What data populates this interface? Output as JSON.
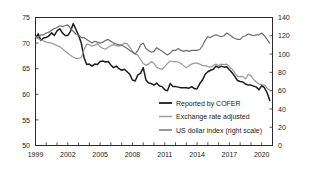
{
  "chart_data": {
    "type": "line",
    "title": "",
    "subtitle": "",
    "xlabel": "",
    "ylabel": "",
    "y2label": "",
    "xlim": [
      1999,
      2021
    ],
    "ylim": [
      50,
      75
    ],
    "y2lim": [
      0,
      140
    ],
    "grid": false,
    "legend_position": "inside-center-bottom",
    "x_ticks": [
      "1999",
      "2002",
      "2005",
      "2008",
      "2011",
      "2014",
      "2017",
      "2020"
    ],
    "x_tick_values": [
      1999,
      2002,
      2005,
      2008,
      2011,
      2014,
      2017,
      2020
    ],
    "x_minor_tick_values": [
      1999,
      2000,
      2001,
      2002,
      2003,
      2004,
      2005,
      2006,
      2007,
      2008,
      2009,
      2010,
      2011,
      2012,
      2013,
      2014,
      2015,
      2016,
      2017,
      2018,
      2019,
      2020,
      2021
    ],
    "y_ticks": [
      "75",
      "70",
      "65",
      "60",
      "55",
      "50"
    ],
    "y_tick_values": [
      75,
      70,
      65,
      60,
      55,
      50
    ],
    "y2_ticks": [
      "140",
      "120",
      "100",
      "80",
      "60",
      "40",
      "20",
      "0"
    ],
    "y2_tick_values": [
      140,
      120,
      100,
      80,
      60,
      40,
      20,
      0
    ],
    "series": [
      {
        "name": "Reported by COFER",
        "axis": "left",
        "color": "#1c1c1c",
        "width": 1.5,
        "x": [
          1999.0,
          1999.25,
          1999.5,
          1999.75,
          2000.0,
          2000.25,
          2000.5,
          2000.75,
          2001.0,
          2001.25,
          2001.5,
          2001.75,
          2002.0,
          2002.25,
          2002.5,
          2002.75,
          2003.0,
          2003.25,
          2003.5,
          2003.75,
          2004.0,
          2004.25,
          2004.5,
          2004.75,
          2005.0,
          2005.25,
          2005.5,
          2005.75,
          2006.0,
          2006.25,
          2006.5,
          2006.75,
          2007.0,
          2007.25,
          2007.5,
          2007.75,
          2008.0,
          2008.25,
          2008.5,
          2008.75,
          2009.0,
          2009.25,
          2009.5,
          2009.75,
          2010.0,
          2010.25,
          2010.5,
          2010.75,
          2011.0,
          2011.25,
          2011.5,
          2011.75,
          2012.0,
          2012.25,
          2012.5,
          2012.75,
          2013.0,
          2013.25,
          2013.5,
          2013.75,
          2014.0,
          2014.25,
          2014.5,
          2014.75,
          2015.0,
          2015.25,
          2015.5,
          2015.75,
          2016.0,
          2016.25,
          2016.5,
          2016.75,
          2017.0,
          2017.25,
          2017.5,
          2017.75,
          2018.0,
          2018.25,
          2018.5,
          2018.75,
          2019.0,
          2019.25,
          2019.5,
          2019.75,
          2020.0,
          2020.25,
          2020.5,
          2020.75
        ],
        "values": [
          70.9,
          71.8,
          70.5,
          71.0,
          71.1,
          71.4,
          72.0,
          71.5,
          72.4,
          72.8,
          72.0,
          71.5,
          71.5,
          72.3,
          73.8,
          72.7,
          71.5,
          70.0,
          67.2,
          65.8,
          65.9,
          65.5,
          65.9,
          65.8,
          66.4,
          66.5,
          66.3,
          66.4,
          65.7,
          65.2,
          65.5,
          65.0,
          64.7,
          64.9,
          64.4,
          63.9,
          62.8,
          62.6,
          63.8,
          64.1,
          65.2,
          62.8,
          62.2,
          62.1,
          61.8,
          62.2,
          61.6,
          61.5,
          60.9,
          60.7,
          62.1,
          61.5,
          61.5,
          61.4,
          61.3,
          61.3,
          61.3,
          61.2,
          61.5,
          61.1,
          61.1,
          62.1,
          62.8,
          63.9,
          64.4,
          64.7,
          64.9,
          65.5,
          65.2,
          65.5,
          65.3,
          65.4,
          64.8,
          64.2,
          63.5,
          62.7,
          62.5,
          62.4,
          62.0,
          61.8,
          61.8,
          61.6,
          61.4,
          60.9,
          61.7,
          61.3,
          60.3,
          58.8
        ]
      },
      {
        "name": "Exchange rate adjusted",
        "axis": "left",
        "color": "#9a9a9a",
        "width": 1.2,
        "x": [
          1999.0,
          1999.25,
          1999.5,
          1999.75,
          2000.0,
          2000.25,
          2000.5,
          2000.75,
          2001.0,
          2001.25,
          2001.5,
          2001.75,
          2002.0,
          2002.25,
          2002.5,
          2002.75,
          2003.0,
          2003.25,
          2003.5,
          2003.75,
          2004.0,
          2004.25,
          2004.5,
          2004.75,
          2005.0,
          2005.25,
          2005.5,
          2005.75,
          2006.0,
          2006.25,
          2006.5,
          2006.75,
          2007.0,
          2007.25,
          2007.5,
          2007.75,
          2008.0,
          2008.25,
          2008.5,
          2008.75,
          2009.0,
          2009.25,
          2009.5,
          2009.75,
          2010.0,
          2010.25,
          2010.5,
          2010.75,
          2011.0,
          2011.25,
          2011.5,
          2011.75,
          2012.0,
          2012.25,
          2012.5,
          2012.75,
          2013.0,
          2013.25,
          2013.5,
          2013.75,
          2014.0,
          2014.25,
          2014.5,
          2014.75,
          2015.0,
          2015.25,
          2015.5,
          2015.75,
          2016.0,
          2016.25,
          2016.5,
          2016.75,
          2017.0,
          2017.25,
          2017.5,
          2017.75,
          2018.0,
          2018.25,
          2018.5,
          2018.75,
          2019.0,
          2019.25,
          2019.5,
          2019.75,
          2020.0,
          2020.25,
          2020.5,
          2020.75
        ],
        "values": [
          71.2,
          70.9,
          70.6,
          70.4,
          70.2,
          70.1,
          70.0,
          69.8,
          69.5,
          69.3,
          68.9,
          68.4,
          68.0,
          67.6,
          67.3,
          67.0,
          67.0,
          67.2,
          68.7,
          69.8,
          69.7,
          69.4,
          69.6,
          69.9,
          69.3,
          69.0,
          68.8,
          69.2,
          69.5,
          69.7,
          69.5,
          69.4,
          69.6,
          70.0,
          69.9,
          69.2,
          68.4,
          67.9,
          67.6,
          66.8,
          66.0,
          65.7,
          65.9,
          66.4,
          66.0,
          65.3,
          65.0,
          64.9,
          65.4,
          66.0,
          66.5,
          66.4,
          66.4,
          66.3,
          66.0,
          65.6,
          65.2,
          65.6,
          65.9,
          66.1,
          66.1,
          65.9,
          65.6,
          65.6,
          65.4,
          65.3,
          65.6,
          65.9,
          65.6,
          65.9,
          65.8,
          65.9,
          65.4,
          64.9,
          64.2,
          63.5,
          63.4,
          63.5,
          63.0,
          63.9,
          63.6,
          62.9,
          62.4,
          62.0,
          61.9,
          61.8,
          61.2,
          60.8
        ]
      },
      {
        "name": "US dollar index (right scale)",
        "axis": "right",
        "color": "#6e6e6e",
        "width": 1.2,
        "x": [
          1999.0,
          1999.25,
          1999.5,
          1999.75,
          2000.0,
          2000.25,
          2000.5,
          2000.75,
          2001.0,
          2001.25,
          2001.5,
          2001.75,
          2002.0,
          2002.25,
          2002.5,
          2002.75,
          2003.0,
          2003.25,
          2003.5,
          2003.75,
          2004.0,
          2004.25,
          2004.5,
          2004.75,
          2005.0,
          2005.25,
          2005.5,
          2005.75,
          2006.0,
          2006.25,
          2006.5,
          2006.75,
          2007.0,
          2007.25,
          2007.5,
          2007.75,
          2008.0,
          2008.25,
          2008.5,
          2008.75,
          2009.0,
          2009.25,
          2009.5,
          2009.75,
          2010.0,
          2010.25,
          2010.5,
          2010.75,
          2011.0,
          2011.25,
          2011.5,
          2011.75,
          2012.0,
          2012.25,
          2012.5,
          2012.75,
          2013.0,
          2013.25,
          2013.5,
          2013.75,
          2014.0,
          2014.25,
          2014.5,
          2014.75,
          2015.0,
          2015.25,
          2015.5,
          2015.75,
          2016.0,
          2016.25,
          2016.5,
          2016.75,
          2017.0,
          2017.25,
          2017.5,
          2017.75,
          2018.0,
          2018.25,
          2018.5,
          2018.75,
          2019.0,
          2019.25,
          2019.5,
          2019.75,
          2020.0,
          2020.25,
          2020.5,
          2020.75
        ],
        "values": [
          119,
          118,
          121,
          121,
          123,
          124,
          126,
          128,
          129,
          131,
          130,
          131,
          132,
          128,
          125,
          122,
          121,
          118,
          118,
          116,
          114,
          112,
          114,
          113,
          112,
          113,
          115,
          116,
          114,
          112,
          111,
          110,
          110,
          108,
          106,
          104,
          102,
          100,
          104,
          110,
          112,
          106,
          104,
          102,
          103,
          107,
          105,
          103,
          101,
          99,
          101,
          104,
          104,
          106,
          104,
          103,
          104,
          103,
          104,
          104,
          104,
          105,
          109,
          115,
          119,
          118,
          120,
          121,
          120,
          119,
          120,
          123,
          121,
          119,
          117,
          116,
          116,
          119,
          120,
          122,
          121,
          120,
          121,
          121,
          123,
          120,
          116,
          112
        ]
      }
    ]
  },
  "legend": {
    "items": [
      {
        "label": "Reported by COFER",
        "color": "#1c1c1c"
      },
      {
        "label": "Exchange rate adjusted",
        "color": "#9a9a9a"
      },
      {
        "label": "US dollar index (right scale)",
        "color": "#6e6e6e"
      }
    ]
  },
  "colors": {
    "axis": "#2b2b2b",
    "text": "#1a1a1a",
    "background": "#ffffff"
  }
}
